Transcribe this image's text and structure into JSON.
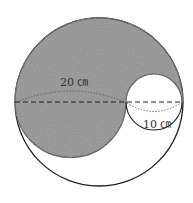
{
  "diagram": {
    "big_circle": {
      "cx": 99,
      "cy": 102,
      "r": 84
    },
    "small_circle": {
      "cx": 154,
      "cy": 102,
      "r": 28
    },
    "shaded_color": "#8a8a8a",
    "labels": {
      "large_diameter": "20 ㎝",
      "small_diameter": "10 ㎝"
    }
  }
}
